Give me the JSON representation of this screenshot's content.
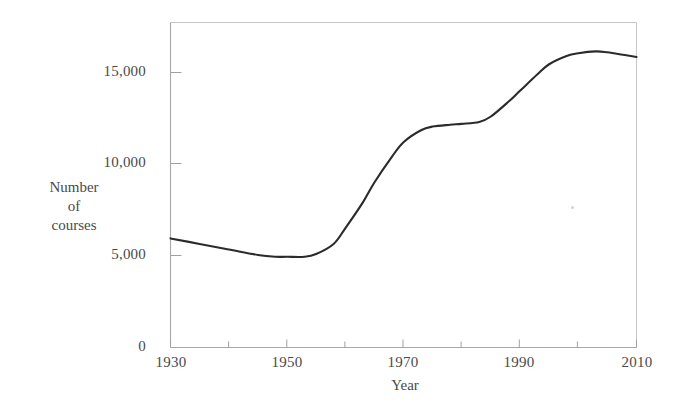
{
  "chart_data": {
    "type": "line",
    "title": "",
    "subtitle": "",
    "xlabel": "Year",
    "ylabel": "Number of courses",
    "ylabel_lines": [
      "Number",
      "of",
      "courses"
    ],
    "xlim": [
      1930,
      2010
    ],
    "ylim": [
      0,
      17500
    ],
    "grid": false,
    "legend": null,
    "x_ticks": [
      1930,
      1950,
      1970,
      1990,
      2010
    ],
    "x_tick_labels": [
      "1930",
      "1950",
      "1970",
      "1990",
      "2010"
    ],
    "x_minor_ticks": [
      1940,
      1960,
      1980,
      2000
    ],
    "y_ticks": [
      0,
      5000,
      10000,
      15000
    ],
    "y_tick_labels": [
      "0",
      "5,000",
      "10,000",
      "15,000"
    ],
    "series": [
      {
        "name": "Number of courses",
        "color": "#2b2b2b",
        "x": [
          1930,
          1935,
          1940,
          1945,
          1948,
          1950,
          1953,
          1955,
          1958,
          1960,
          1963,
          1965,
          1968,
          1970,
          1973,
          1975,
          1978,
          1980,
          1983,
          1985,
          1988,
          1990,
          1993,
          1995,
          1998,
          2000,
          2003,
          2005,
          2008,
          2010
        ],
        "values": [
          5950,
          5650,
          5350,
          5050,
          4950,
          4950,
          4950,
          5100,
          5650,
          6500,
          7900,
          9000,
          10400,
          11200,
          11850,
          12050,
          12150,
          12200,
          12300,
          12600,
          13400,
          14000,
          14900,
          15450,
          15900,
          16050,
          16150,
          16100,
          15950,
          15850
        ]
      }
    ]
  },
  "axes": {
    "frame_color": "#b7b7b7",
    "tick_color": "#9a9a9a",
    "text_color": "#4a4a4a"
  }
}
